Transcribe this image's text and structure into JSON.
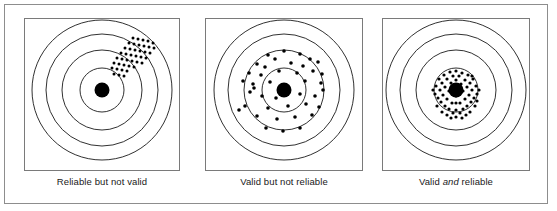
{
  "figure": {
    "background_color": "#ffffff",
    "frame_color": "#8d8d8d",
    "panel_border_color": "#7a7a7a",
    "ring_color": "#1a1a1a",
    "dot_color": "#000000",
    "caption_color": "#202020"
  },
  "panels": [
    {
      "id": "reliable-not-valid",
      "caption_prefix": "Reliable but not valid",
      "caption_emphasis": "",
      "caption_suffix": "",
      "target": {
        "center_x": 78,
        "center_y": 72,
        "bullseye_radius": 7.5,
        "ring_radii": [
          22,
          40,
          56,
          70
        ],
        "dot_radius": 1.5
      },
      "dots": [
        [
          109,
          20
        ],
        [
          114,
          21
        ],
        [
          119,
          22
        ],
        [
          124,
          23
        ],
        [
          129,
          25
        ],
        [
          105,
          25
        ],
        [
          110,
          26
        ],
        [
          115,
          27
        ],
        [
          120,
          28
        ],
        [
          125,
          29
        ],
        [
          130,
          30
        ],
        [
          101,
          30
        ],
        [
          106,
          31
        ],
        [
          111,
          32
        ],
        [
          116,
          33
        ],
        [
          121,
          34
        ],
        [
          126,
          35
        ],
        [
          97,
          35
        ],
        [
          102,
          36
        ],
        [
          107,
          37
        ],
        [
          112,
          38
        ],
        [
          117,
          39
        ],
        [
          122,
          40
        ],
        [
          93,
          40
        ],
        [
          98,
          41
        ],
        [
          103,
          42
        ],
        [
          108,
          43
        ],
        [
          113,
          44
        ],
        [
          118,
          45
        ],
        [
          90,
          45
        ],
        [
          95,
          46
        ],
        [
          100,
          47
        ],
        [
          105,
          48
        ],
        [
          110,
          49
        ],
        [
          88,
          50
        ],
        [
          93,
          51
        ],
        [
          98,
          52
        ],
        [
          103,
          53
        ],
        [
          90,
          56
        ],
        [
          95,
          57
        ],
        [
          100,
          58
        ]
      ]
    },
    {
      "id": "valid-not-reliable",
      "caption_prefix": "Valid but not reliable",
      "caption_emphasis": "",
      "caption_suffix": "",
      "target": {
        "center_x": 79,
        "center_y": 72,
        "bullseye_radius": 7.5,
        "ring_radii": [
          22,
          40,
          56,
          70
        ],
        "dot_radius": 1.8
      },
      "dots": [
        [
          79,
          33
        ],
        [
          63,
          37
        ],
        [
          70,
          41
        ],
        [
          95,
          36
        ],
        [
          105,
          41
        ],
        [
          52,
          46
        ],
        [
          60,
          49
        ],
        [
          86,
          45
        ],
        [
          98,
          48
        ],
        [
          113,
          44
        ],
        [
          44,
          55
        ],
        [
          56,
          57
        ],
        [
          74,
          53
        ],
        [
          92,
          55
        ],
        [
          108,
          53
        ],
        [
          117,
          56
        ],
        [
          38,
          63
        ],
        [
          48,
          66
        ],
        [
          49,
          70
        ],
        [
          45,
          74
        ],
        [
          65,
          64
        ],
        [
          100,
          63
        ],
        [
          116,
          65
        ],
        [
          57,
          78
        ],
        [
          71,
          80
        ],
        [
          95,
          76
        ],
        [
          110,
          78
        ],
        [
          118,
          72
        ],
        [
          40,
          88
        ],
        [
          34,
          92
        ],
        [
          63,
          90
        ],
        [
          83,
          88
        ],
        [
          101,
          86
        ],
        [
          114,
          89
        ],
        [
          52,
          98
        ],
        [
          72,
          101
        ],
        [
          90,
          99
        ],
        [
          107,
          97
        ],
        [
          61,
          110
        ],
        [
          78,
          113
        ],
        [
          95,
          110
        ]
      ]
    },
    {
      "id": "valid-and-reliable",
      "caption_prefix": "Valid ",
      "caption_emphasis": "and",
      "caption_suffix": " reliable",
      "target": {
        "center_x": 74,
        "center_y": 72,
        "bullseye_radius": 7.5,
        "ring_radii": [
          22,
          40,
          56,
          70
        ],
        "dot_radius": 1.6
      },
      "dots": [
        [
          74,
          53
        ],
        [
          68,
          54
        ],
        [
          80,
          55
        ],
        [
          62,
          57
        ],
        [
          86,
          57
        ],
        [
          71,
          58
        ],
        [
          77,
          58
        ],
        [
          57,
          61
        ],
        [
          91,
          61
        ],
        [
          65,
          61
        ],
        [
          83,
          62
        ],
        [
          74,
          62
        ],
        [
          60,
          65
        ],
        [
          88,
          65
        ],
        [
          69,
          65
        ],
        [
          79,
          66
        ],
        [
          54,
          68
        ],
        [
          94,
          68
        ],
        [
          63,
          69
        ],
        [
          85,
          69
        ],
        [
          74,
          69
        ],
        [
          58,
          72
        ],
        [
          90,
          72
        ],
        [
          67,
          73
        ],
        [
          81,
          73
        ],
        [
          53,
          76
        ],
        [
          95,
          76
        ],
        [
          61,
          77
        ],
        [
          87,
          77
        ],
        [
          74,
          78
        ],
        [
          56,
          80
        ],
        [
          92,
          80
        ],
        [
          65,
          81
        ],
        [
          83,
          81
        ],
        [
          59,
          84
        ],
        [
          89,
          84
        ],
        [
          70,
          85
        ],
        [
          78,
          85
        ],
        [
          74,
          85
        ],
        [
          63,
          88
        ],
        [
          85,
          88
        ],
        [
          55,
          88
        ],
        [
          93,
          88
        ],
        [
          67,
          91
        ],
        [
          81,
          91
        ],
        [
          74,
          92
        ],
        [
          60,
          94
        ],
        [
          88,
          94
        ],
        [
          71,
          95
        ],
        [
          78,
          95
        ],
        [
          65,
          97
        ],
        [
          84,
          97
        ],
        [
          74,
          99
        ],
        [
          69,
          100
        ],
        [
          80,
          100
        ],
        [
          90,
          58
        ],
        [
          95,
          83
        ],
        [
          51,
          72
        ],
        [
          97,
          72
        ]
      ]
    }
  ]
}
